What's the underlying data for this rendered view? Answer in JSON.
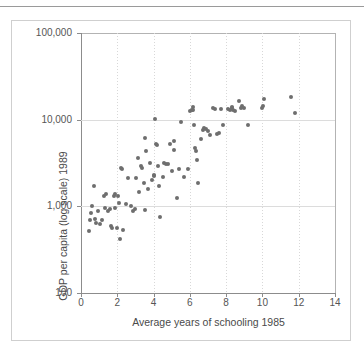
{
  "chart_data": {
    "type": "scatter",
    "title": "",
    "xlabel": "Average years of schooling 1985",
    "ylabel": "GDP per capita (log scale) 1989",
    "xlim": [
      0,
      14
    ],
    "ylim": [
      100,
      100000
    ],
    "yscale": "log",
    "grid": true,
    "legend": "none",
    "xticks": [
      "0",
      "2",
      "4",
      "6",
      "8",
      "10",
      "12",
      "14"
    ],
    "xtick_values": [
      0,
      2,
      4,
      6,
      8,
      10,
      12,
      14
    ],
    "yticks": [
      "100",
      "1,000",
      "10,000",
      "100,000"
    ],
    "ytick_values": [
      100,
      1000,
      10000,
      100000
    ],
    "marker": {
      "shape": "circle",
      "color": "#6e6e6e",
      "size_px": 4
    },
    "points": [
      {
        "x": 0.45,
        "y": 520
      },
      {
        "x": 0.5,
        "y": 700
      },
      {
        "x": 0.55,
        "y": 830
      },
      {
        "x": 0.62,
        "y": 1000
      },
      {
        "x": 0.72,
        "y": 1700
      },
      {
        "x": 0.78,
        "y": 720
      },
      {
        "x": 0.85,
        "y": 640
      },
      {
        "x": 0.95,
        "y": 880
      },
      {
        "x": 1.05,
        "y": 620
      },
      {
        "x": 1.15,
        "y": 700
      },
      {
        "x": 1.25,
        "y": 1300
      },
      {
        "x": 1.3,
        "y": 950
      },
      {
        "x": 1.4,
        "y": 1400
      },
      {
        "x": 1.5,
        "y": 880
      },
      {
        "x": 1.6,
        "y": 930
      },
      {
        "x": 1.65,
        "y": 600
      },
      {
        "x": 1.72,
        "y": 560
      },
      {
        "x": 1.8,
        "y": 1300
      },
      {
        "x": 1.85,
        "y": 1380
      },
      {
        "x": 1.9,
        "y": 950
      },
      {
        "x": 2.0,
        "y": 560
      },
      {
        "x": 2.05,
        "y": 1300
      },
      {
        "x": 2.1,
        "y": 1100
      },
      {
        "x": 2.15,
        "y": 420
      },
      {
        "x": 2.2,
        "y": 2750
      },
      {
        "x": 2.25,
        "y": 2700
      },
      {
        "x": 2.3,
        "y": 540
      },
      {
        "x": 2.5,
        "y": 1050
      },
      {
        "x": 2.6,
        "y": 2150
      },
      {
        "x": 2.75,
        "y": 1000
      },
      {
        "x": 2.85,
        "y": 880
      },
      {
        "x": 2.95,
        "y": 920
      },
      {
        "x": 3.05,
        "y": 2150
      },
      {
        "x": 3.15,
        "y": 3650
      },
      {
        "x": 3.2,
        "y": 1450
      },
      {
        "x": 3.3,
        "y": 2950
      },
      {
        "x": 3.35,
        "y": 2750
      },
      {
        "x": 3.45,
        "y": 1850
      },
      {
        "x": 3.5,
        "y": 900
      },
      {
        "x": 3.55,
        "y": 6200
      },
      {
        "x": 3.6,
        "y": 4400
      },
      {
        "x": 3.7,
        "y": 1600
      },
      {
        "x": 3.8,
        "y": 3150
      },
      {
        "x": 3.9,
        "y": 2000
      },
      {
        "x": 4.0,
        "y": 2300
      },
      {
        "x": 4.05,
        "y": 2250
      },
      {
        "x": 4.1,
        "y": 10200
      },
      {
        "x": 4.15,
        "y": 5300
      },
      {
        "x": 4.2,
        "y": 5100
      },
      {
        "x": 4.25,
        "y": 2950
      },
      {
        "x": 4.3,
        "y": 1700
      },
      {
        "x": 4.35,
        "y": 760
      },
      {
        "x": 4.5,
        "y": 2200
      },
      {
        "x": 4.6,
        "y": 3150
      },
      {
        "x": 4.7,
        "y": 3050
      },
      {
        "x": 4.8,
        "y": 3100
      },
      {
        "x": 4.9,
        "y": 5200
      },
      {
        "x": 5.0,
        "y": 2550
      },
      {
        "x": 5.1,
        "y": 5600
      },
      {
        "x": 5.15,
        "y": 4500
      },
      {
        "x": 5.3,
        "y": 1250
      },
      {
        "x": 5.4,
        "y": 2700
      },
      {
        "x": 5.5,
        "y": 9500
      },
      {
        "x": 5.7,
        "y": 2200
      },
      {
        "x": 5.9,
        "y": 2700
      },
      {
        "x": 6.0,
        "y": 12500
      },
      {
        "x": 6.1,
        "y": 13000
      },
      {
        "x": 6.15,
        "y": 12800
      },
      {
        "x": 6.2,
        "y": 14000
      },
      {
        "x": 6.25,
        "y": 8700
      },
      {
        "x": 6.3,
        "y": 4700
      },
      {
        "x": 6.35,
        "y": 4400
      },
      {
        "x": 6.4,
        "y": 3450
      },
      {
        "x": 6.45,
        "y": 1850
      },
      {
        "x": 6.6,
        "y": 6000
      },
      {
        "x": 6.7,
        "y": 7600
      },
      {
        "x": 6.8,
        "y": 8000
      },
      {
        "x": 6.9,
        "y": 7800
      },
      {
        "x": 7.0,
        "y": 7400
      },
      {
        "x": 7.1,
        "y": 6600
      },
      {
        "x": 7.3,
        "y": 13800
      },
      {
        "x": 7.4,
        "y": 13200
      },
      {
        "x": 7.5,
        "y": 6800
      },
      {
        "x": 7.6,
        "y": 7000
      },
      {
        "x": 7.7,
        "y": 13200
      },
      {
        "x": 7.8,
        "y": 8700
      },
      {
        "x": 8.1,
        "y": 13400
      },
      {
        "x": 8.2,
        "y": 12900
      },
      {
        "x": 8.3,
        "y": 14000
      },
      {
        "x": 8.35,
        "y": 13600
      },
      {
        "x": 8.4,
        "y": 13000
      },
      {
        "x": 8.5,
        "y": 12600
      },
      {
        "x": 8.7,
        "y": 16500
      },
      {
        "x": 8.8,
        "y": 13500
      },
      {
        "x": 8.9,
        "y": 14200
      },
      {
        "x": 9.0,
        "y": 13800
      },
      {
        "x": 9.2,
        "y": 8700
      },
      {
        "x": 10.0,
        "y": 13800
      },
      {
        "x": 10.05,
        "y": 14200
      },
      {
        "x": 10.1,
        "y": 17500
      },
      {
        "x": 11.6,
        "y": 18500
      },
      {
        "x": 11.8,
        "y": 11800
      }
    ]
  }
}
